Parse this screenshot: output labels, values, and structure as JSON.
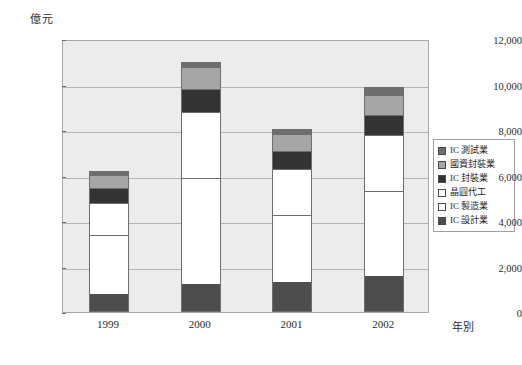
{
  "chart_data": {
    "type": "bar",
    "stacked": true,
    "title": "",
    "unit_label": "億元",
    "xlabel": "年別",
    "ylabel": "",
    "categories": [
      "1999",
      "2000",
      "2001",
      "2002"
    ],
    "ylim": [
      0,
      12000
    ],
    "ytick_step": 2000,
    "yticks": [
      "0",
      "2,000",
      "4,000",
      "6,000",
      "8,000",
      "10,000",
      "12,000"
    ],
    "ytick_values": [
      0,
      2000,
      4000,
      6000,
      8000,
      10000,
      12000
    ],
    "grid": true,
    "legend_position": "right",
    "series": [
      {
        "name": "IC 設計業",
        "color": "#4d4d4d",
        "values": [
          750,
          1180,
          1270,
          1570
        ]
      },
      {
        "name": "IC 製造業",
        "color": "#ffffff",
        "values": [
          2650,
          4720,
          3010,
          3750
        ]
      },
      {
        "name": "晶圓代工",
        "color": "#ffffff",
        "values": [
          1400,
          2900,
          2050,
          2480
        ]
      },
      {
        "name": "IC 封裝業",
        "color": "#333333",
        "values": [
          700,
          1050,
          770,
          900
        ]
      },
      {
        "name": "國資封裝業",
        "color": "#a6a6a6",
        "values": [
          550,
          950,
          750,
          860
        ]
      },
      {
        "name": "IC 測試業",
        "color": "#6e6e6e",
        "values": [
          150,
          200,
          200,
          340
        ]
      }
    ],
    "totals": [
      6200,
      11000,
      8050,
      9900
    ],
    "legend_order": [
      "IC 測試業",
      "國資封裝業",
      "IC 封裝業",
      "晶圓代工",
      "IC 製造業",
      "IC 設計業"
    ]
  },
  "legend": {
    "items": [
      {
        "label": "IC 測試業",
        "color": "#6e6e6e"
      },
      {
        "label": "國資封裝業",
        "color": "#a6a6a6"
      },
      {
        "label": "IC 封裝業",
        "color": "#333333"
      },
      {
        "label": "晶圓代工",
        "color": "#ffffff"
      },
      {
        "label": "IC 製造業",
        "color": "#ffffff"
      },
      {
        "label": "IC 設計業",
        "color": "#4d4d4d"
      }
    ]
  }
}
